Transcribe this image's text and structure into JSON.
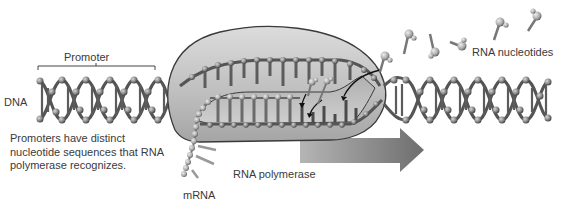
{
  "diagram": {
    "labels": {
      "promoter": "Promoter",
      "dna": "DNA",
      "rna_nucleotides": "RNA nucleotides",
      "rna_polymerase": "RNA polymerase",
      "mrna": "mRNA"
    },
    "caption": {
      "line1": "Promoters have distinct",
      "line2": "nucleotide sequences that RNA",
      "line3": "polymerase recognizes."
    },
    "colors": {
      "background": "#ffffff",
      "polymerase_fill": "#c9c9c9",
      "polymerase_stroke": "#3a3a3a",
      "dna_backbone": "#5a5a5a",
      "dna_beads": "#8a8a8a",
      "arrow": "#7a7a7a",
      "text": "#3a3a3a"
    },
    "components": [
      "DNA double helix",
      "Promoter region",
      "RNA polymerase",
      "Unwound DNA bubble",
      "mRNA strand",
      "Free RNA nucleotides",
      "Direction of transcription arrow"
    ]
  }
}
